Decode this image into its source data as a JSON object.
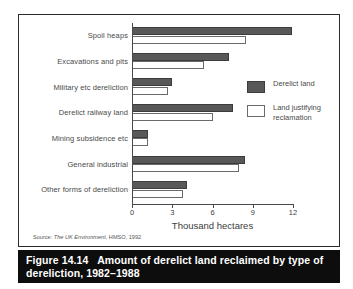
{
  "figure": {
    "caption_prefix": "Figure 14.14",
    "caption_text": "Amount of derelict land reclaimed by type of dereliction, 1982–1988",
    "source": "Source:  The UK Environment, HMSO, 1992",
    "source_label": "Source:",
    "source_publication": "The UK Environment",
    "source_rest": ", HMSO, 1992"
  },
  "legend": {
    "position": "right-inside",
    "items": [
      {
        "label": "Derelict land",
        "color": "#585858",
        "style": "filled"
      },
      {
        "label": "Land justifying reclamation",
        "color": "#ffffff",
        "style": "outline"
      }
    ]
  },
  "colors": {
    "derelict_land": "#585858",
    "land_justifying_reclamation": "#ffffff",
    "outline": "#3c3c3c",
    "axis": "#4a4a4a",
    "caption_bar": "#0d0d0d",
    "caption_text": "#ffffff",
    "panel_background": "#ffffff",
    "panel_border": "#2b2b2b"
  },
  "chart_data": {
    "type": "bar",
    "orientation": "horizontal",
    "title": "Amount of derelict land reclaimed by type of dereliction, 1982–1988",
    "xlabel": "Thousand hectares",
    "ylabel": "",
    "xlim": [
      0,
      12
    ],
    "xticks": [
      0,
      3,
      6,
      9,
      12
    ],
    "xticklabels": [
      "0",
      "3",
      "6",
      "9",
      "12"
    ],
    "grid": false,
    "legend_entries": [
      "Derelict land",
      "Land justifying reclamation"
    ],
    "categories": [
      "Spoil heaps",
      "Excavations and pits",
      "Military etc dereliction",
      "Derelict railway land",
      "Mining subsidence etc",
      "General industrial",
      "Other forms of dereliction"
    ],
    "series": [
      {
        "name": "Derelict land",
        "values": [
          11.9,
          7.2,
          3.0,
          7.5,
          1.2,
          8.4,
          4.1
        ]
      },
      {
        "name": "Land justifying reclamation",
        "values": [
          8.5,
          5.4,
          2.7,
          6.0,
          1.2,
          8.0,
          3.8
        ]
      }
    ]
  }
}
